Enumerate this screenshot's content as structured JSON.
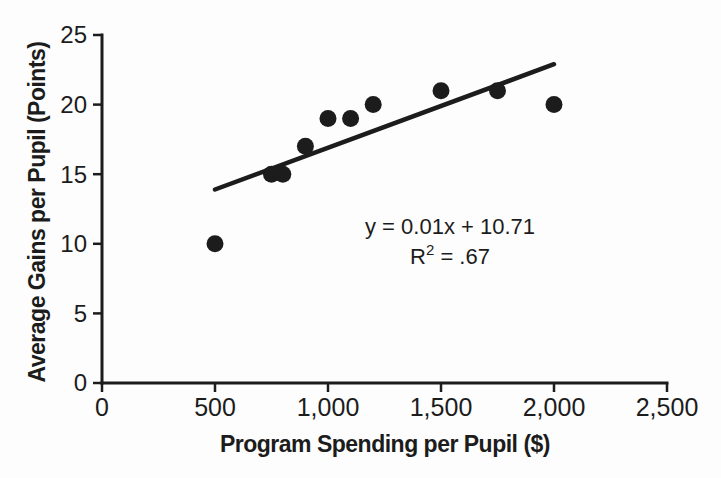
{
  "figure": {
    "background_color": "#fdfdfd",
    "ink_color": "#1c1c1c"
  },
  "chart_data": {
    "type": "scatter",
    "title": "",
    "xlabel": "Program Spending per Pupil ($)",
    "ylabel": "Average Gains per Pupil (Points)",
    "xlim": [
      0,
      2500
    ],
    "ylim": [
      0,
      25
    ],
    "grid": false,
    "legend": null,
    "x_ticks": [
      {
        "value": 0,
        "label": "0"
      },
      {
        "value": 500,
        "label": "500"
      },
      {
        "value": 1000,
        "label": "1,000"
      },
      {
        "value": 1500,
        "label": "1,500"
      },
      {
        "value": 2000,
        "label": "2,000"
      },
      {
        "value": 2500,
        "label": "2,500"
      }
    ],
    "y_ticks": [
      {
        "value": 0,
        "label": "0"
      },
      {
        "value": 5,
        "label": "5"
      },
      {
        "value": 10,
        "label": "10"
      },
      {
        "value": 15,
        "label": "15"
      },
      {
        "value": 20,
        "label": "20"
      },
      {
        "value": 25,
        "label": "25"
      }
    ],
    "points": [
      {
        "x": 500,
        "y": 10
      },
      {
        "x": 750,
        "y": 15
      },
      {
        "x": 800,
        "y": 15
      },
      {
        "x": 900,
        "y": 17
      },
      {
        "x": 1000,
        "y": 19
      },
      {
        "x": 1100,
        "y": 19
      },
      {
        "x": 1200,
        "y": 20
      },
      {
        "x": 1500,
        "y": 21
      },
      {
        "x": 1750,
        "y": 21
      },
      {
        "x": 2000,
        "y": 20
      }
    ],
    "trendline": {
      "x_start": 500,
      "y_start": 13.9,
      "x_end": 2000,
      "y_end": 22.9
    },
    "annotations": {
      "equation": "y = 0.01x + 10.71",
      "r_squared": {
        "base": "R",
        "superscript": "2",
        "rest": " = .67"
      }
    }
  }
}
